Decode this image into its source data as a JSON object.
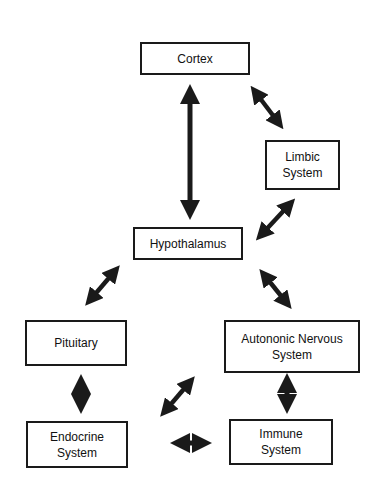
{
  "diagram": {
    "nodes": {
      "cortex": {
        "label": "Cortex"
      },
      "limbic": {
        "line1": "Limbic",
        "line2": "System"
      },
      "hypothalamus": {
        "label": "Hypothalamus"
      },
      "pituitary": {
        "label": "Pituitary"
      },
      "autonomic": {
        "line1": "Autononic Nervous",
        "line2": "System"
      },
      "endocrine": {
        "line1": "Endocrine",
        "line2": "System"
      },
      "immune": {
        "line1": "Immune",
        "line2": "System"
      }
    },
    "edges": [
      {
        "from": "Cortex",
        "to": "Hypothalamus",
        "type": "bidirectional"
      },
      {
        "from": "Cortex",
        "to": "Limbic System",
        "type": "bidirectional"
      },
      {
        "from": "Limbic System",
        "to": "Hypothalamus",
        "type": "bidirectional"
      },
      {
        "from": "Hypothalamus",
        "to": "Pituitary",
        "type": "bidirectional"
      },
      {
        "from": "Hypothalamus",
        "to": "Autononic Nervous System",
        "type": "bidirectional"
      },
      {
        "from": "Pituitary",
        "to": "Endocrine System",
        "type": "bidirectional"
      },
      {
        "from": "Autononic Nervous System",
        "to": "Immune System",
        "type": "bidirectional"
      },
      {
        "from": "Autononic Nervous System",
        "to": "Endocrine System",
        "type": "bidirectional"
      },
      {
        "from": "Endocrine System",
        "to": "Immune System",
        "type": "bidirectional"
      }
    ],
    "colors": {
      "stroke": "#1a1a1a",
      "background": "#ffffff"
    }
  }
}
